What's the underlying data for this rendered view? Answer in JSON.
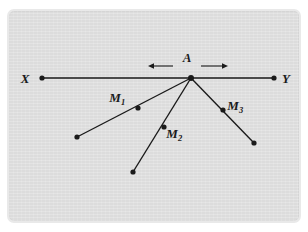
{
  "figure": {
    "caption": "",
    "background_color": "#dcdcdc",
    "frame_color": "#e9e9e9",
    "ink_color": "#1a1a1a",
    "labels": {
      "x": "X",
      "y": "Y",
      "a": "A",
      "m1": "M",
      "m1_sub": "1",
      "m2": "M",
      "m2_sub": "2",
      "m3": "M",
      "m3_sub": "3"
    },
    "points": {
      "x_point": {
        "x": 42,
        "y": 78
      },
      "y_point": {
        "x": 274,
        "y": 78
      },
      "a_point": {
        "x": 191,
        "y": 78
      },
      "m1_point": {
        "x": 138,
        "y": 108
      },
      "m1_end": {
        "x": 77,
        "y": 137
      },
      "m2_point": {
        "x": 164,
        "y": 127
      },
      "m2_end": {
        "x": 133,
        "y": 172
      },
      "m3_point": {
        "x": 223,
        "y": 110
      },
      "m3_end": {
        "x": 254,
        "y": 143
      }
    },
    "label_positions": {
      "x": {
        "x": 25,
        "y": 83
      },
      "y": {
        "x": 281,
        "y": 83
      },
      "a": {
        "x": 182,
        "y": 69
      },
      "m1": {
        "x": 110,
        "y": 100
      },
      "m2": {
        "x": 168,
        "y": 140
      },
      "m3": {
        "x": 228,
        "y": 112
      }
    },
    "arrows": {
      "left": {
        "x1": 173,
        "y1": 66,
        "x2": 149,
        "y2": 66,
        "direction": "left"
      },
      "right": {
        "x1": 201,
        "y1": 66,
        "x2": 228,
        "y2": 66,
        "direction": "right"
      }
    },
    "line_xy": {
      "x1": 42,
      "y1": 78,
      "x2": 274,
      "y2": 78
    }
  }
}
